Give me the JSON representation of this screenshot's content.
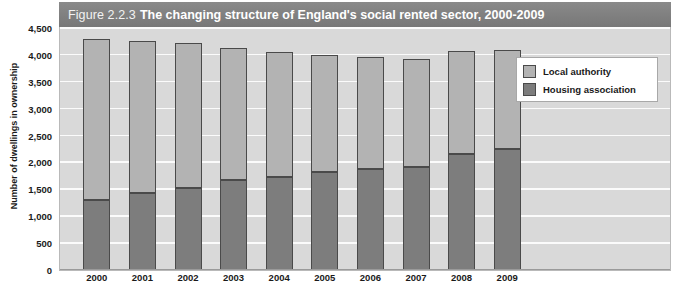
{
  "title": {
    "figure_number": "Figure 2.2.3",
    "text": "The changing structure of England's social rented sector, 2000-2009"
  },
  "legend": {
    "position": "inside-top-right",
    "items": [
      {
        "label": "Local authority",
        "color": "#b3b3b3"
      },
      {
        "label": "Housing association",
        "color": "#7d7d7d"
      }
    ]
  },
  "colors": {
    "banner": "#7f7f7f",
    "plot_background": "#d9d9d9",
    "gridline": "#fbfbfb",
    "bar_outline": "#4a4a4a",
    "local_authority": "#b3b3b3",
    "housing_association": "#7d7d7d"
  },
  "chart_data": {
    "type": "bar",
    "stacked": true,
    "title": "Figure 2.2.3 The changing structure of England's social rented sector, 2000-2009",
    "xlabel": "",
    "ylabel": "Number of dwellings in ownership",
    "categories": [
      "2000",
      "2001",
      "2002",
      "2003",
      "2004",
      "2005",
      "2006",
      "2007",
      "2008",
      "2009"
    ],
    "series": [
      {
        "name": "Housing association",
        "color": "#7d7d7d",
        "values": [
          1300,
          1430,
          1520,
          1680,
          1730,
          1820,
          1880,
          1910,
          2160,
          2250
        ]
      },
      {
        "name": "Local authority",
        "color": "#b3b3b3",
        "values": [
          3000,
          2820,
          2700,
          2450,
          2330,
          2180,
          2090,
          2020,
          1920,
          1850
        ]
      }
    ],
    "totals": [
      4300,
      4250,
      4220,
      4130,
      4060,
      4000,
      3970,
      3930,
      4080,
      4100
    ],
    "ylim": [
      0,
      4500
    ],
    "yticks": [
      0,
      500,
      1000,
      1500,
      2000,
      2500,
      3000,
      3500,
      4000,
      4500
    ],
    "ytick_labels": [
      "0",
      "500",
      "1,000",
      "1,500",
      "2,000",
      "2,500",
      "3,000",
      "3,500",
      "4,000",
      "4,500"
    ],
    "grid": true,
    "grid_axis": "y",
    "legend_position": "inside-top-right"
  }
}
